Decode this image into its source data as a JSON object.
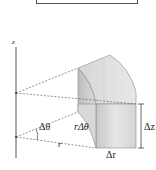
{
  "figure": {
    "type": "cylindrical volume element",
    "top_box": {
      "label": ""
    },
    "labels": {
      "z_axis": "z",
      "delta_theta": "Δθ",
      "r_delta_theta": "rΔθ",
      "r": "r",
      "delta_r": "Δr",
      "delta_z": "Δz"
    },
    "colors": {
      "axis": "#555555",
      "dashed": "#666666",
      "solid_face_light": "#e4e4e4",
      "solid_face_mid": "#cfcfcf",
      "solid_face_dark": "#b8b8b8",
      "edge": "#8a8a8a"
    }
  }
}
